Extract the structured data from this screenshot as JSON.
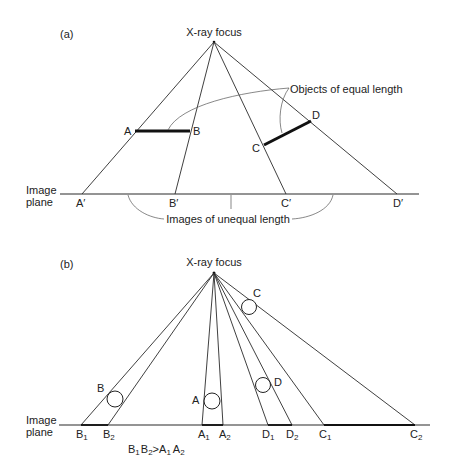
{
  "panel_a": {
    "label": "(a)",
    "focus_label": "X-ray focus",
    "plane_label_line1": "Image",
    "plane_label_line2": "plane",
    "objects_label": "Objects of equal length",
    "images_label": "Images of unequal length",
    "points": {
      "A": "A",
      "B": "B",
      "C": "C",
      "D": "D",
      "A_img": "A′",
      "B_img": "B′",
      "C_img": "C′",
      "D_img": "D′"
    }
  },
  "panel_b": {
    "label": "(b)",
    "focus_label": "X-ray focus",
    "plane_label_line1": "Image",
    "plane_label_line2": "plane",
    "objects": {
      "A": "A",
      "B": "B",
      "C": "C",
      "D": "D"
    },
    "image_points": [
      {
        "base": "B",
        "sub": "1"
      },
      {
        "base": "B",
        "sub": "2"
      },
      {
        "base": "A",
        "sub": "1"
      },
      {
        "base": "A",
        "sub": "2"
      },
      {
        "base": "D",
        "sub": "1"
      },
      {
        "base": "D",
        "sub": "2"
      },
      {
        "base": "C",
        "sub": "1"
      },
      {
        "base": "C",
        "sub": "2"
      }
    ],
    "relation": {
      "b1": "B",
      "s1": "1",
      "b2": "B",
      "s2": "2",
      "op": ">",
      "a1": "A",
      "s3": "1",
      "a2": "A",
      "s4": "2"
    }
  }
}
